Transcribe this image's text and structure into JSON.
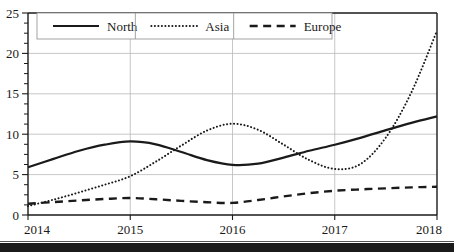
{
  "chart_data": {
    "type": "line",
    "title": "",
    "xlabel": "",
    "ylabel": "",
    "x": [
      2014,
      2015,
      2016,
      2017,
      2018
    ],
    "categories": [
      "2014",
      "2015",
      "2016",
      "2017",
      "2018"
    ],
    "xlim": [
      2014,
      2018
    ],
    "ylim": [
      0,
      25
    ],
    "yticks": [
      0,
      5,
      10,
      15,
      20,
      25
    ],
    "ytick_labels": [
      "0",
      "5",
      "10",
      "15",
      "20",
      "25"
    ],
    "xtick_labels": [
      "2014",
      "2015",
      "2016",
      "2017",
      "2018"
    ],
    "y_minor_ticks": [
      1.25,
      2.5,
      3.75,
      6.25,
      7.5,
      8.75,
      11.25,
      12.5,
      13.75,
      16.25,
      17.5,
      18.75,
      21.25,
      22.5,
      23.75
    ],
    "grid": "major-xy",
    "grid_color": "#b9b9b9",
    "legend_position": "top-inside",
    "series": [
      {
        "name": "North",
        "style": "solid",
        "color": "#1a1a1a",
        "values": [
          5.9,
          9.1,
          6.2,
          8.7,
          12.2
        ],
        "dense_x": [
          2014.0,
          2014.25,
          2014.5,
          2014.75,
          2015.0,
          2015.25,
          2015.5,
          2015.75,
          2016.0,
          2016.25,
          2016.5,
          2016.75,
          2017.0,
          2017.25,
          2017.5,
          2017.75,
          2018.0
        ],
        "dense_y": [
          5.9,
          6.95,
          7.95,
          8.7,
          9.1,
          8.75,
          7.8,
          6.8,
          6.2,
          6.35,
          7.1,
          7.95,
          8.7,
          9.55,
          10.5,
          11.4,
          12.2
        ]
      },
      {
        "name": "Asia",
        "style": "dotted",
        "color": "#1a1a1a",
        "values": [
          1.1,
          4.8,
          11.3,
          5.7,
          22.8
        ],
        "dense_x": [
          2014.0,
          2014.25,
          2014.5,
          2014.75,
          2015.0,
          2015.25,
          2015.5,
          2015.75,
          2016.0,
          2016.25,
          2016.5,
          2016.75,
          2017.0,
          2017.25,
          2017.5,
          2017.75,
          2018.0
        ],
        "dense_y": [
          1.1,
          1.9,
          2.8,
          3.75,
          4.8,
          6.6,
          8.6,
          10.45,
          11.3,
          10.55,
          8.7,
          6.8,
          5.7,
          6.3,
          9.6,
          15.2,
          22.8
        ]
      },
      {
        "name": "Europe",
        "style": "dashed",
        "color": "#1a1a1a",
        "values": [
          1.4,
          2.1,
          1.5,
          3.0,
          3.5
        ],
        "dense_x": [
          2014.0,
          2014.25,
          2014.5,
          2014.75,
          2015.0,
          2015.25,
          2015.5,
          2015.75,
          2016.0,
          2016.25,
          2016.5,
          2016.75,
          2017.0,
          2017.25,
          2017.5,
          2017.75,
          2018.0
        ],
        "dense_y": [
          1.4,
          1.6,
          1.8,
          1.98,
          2.1,
          1.95,
          1.75,
          1.58,
          1.5,
          1.85,
          2.3,
          2.7,
          3.0,
          3.17,
          3.3,
          3.42,
          3.5
        ]
      }
    ],
    "legend_entries": [
      {
        "label": "North",
        "style": "solid"
      },
      {
        "label": "Asia",
        "style": "dotted"
      },
      {
        "label": "Europe",
        "style": "dashed"
      }
    ]
  }
}
